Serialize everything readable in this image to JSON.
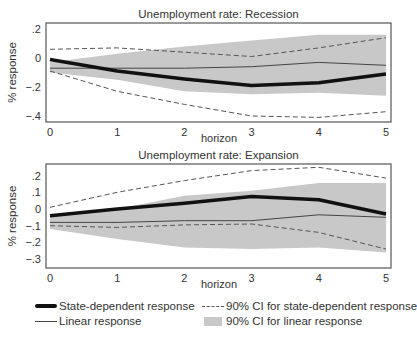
{
  "chart_data": [
    {
      "type": "line",
      "title": "Unemployment rate: Recession",
      "xlabel": "horizon",
      "ylabel": "% response",
      "x": [
        0,
        1,
        2,
        3,
        4,
        5
      ],
      "xticks": [
        "0",
        "1",
        "2",
        "3",
        "4",
        "5"
      ],
      "yticks": [
        0.2,
        0,
        -0.2,
        -0.4
      ],
      "ytick_labels": [
        ".2",
        "0",
        "-.2",
        "-.4"
      ],
      "ylim": [
        -0.44,
        0.24
      ],
      "grid": false,
      "series": [
        {
          "name": "State-dependent response",
          "values": [
            -0.01,
            -0.09,
            -0.145,
            -0.19,
            -0.17,
            -0.11
          ]
        },
        {
          "name": "Linear response",
          "values": [
            -0.07,
            -0.07,
            -0.07,
            -0.06,
            -0.03,
            -0.05
          ]
        },
        {
          "name": "90% CI for state-dependent response (upper)",
          "values": [
            0.06,
            0.07,
            0.04,
            0.01,
            0.07,
            0.14
          ]
        },
        {
          "name": "90% CI for state-dependent response (lower)",
          "values": [
            -0.09,
            -0.23,
            -0.32,
            -0.4,
            -0.41,
            -0.37
          ]
        },
        {
          "name": "90% CI for linear response (upper)",
          "values": [
            -0.03,
            0.03,
            0.08,
            0.12,
            0.16,
            0.16
          ]
        },
        {
          "name": "90% CI for linear response (lower)",
          "values": [
            -0.1,
            -0.15,
            -0.23,
            -0.25,
            -0.24,
            -0.26
          ]
        }
      ]
    },
    {
      "type": "line",
      "title": "Unemployment rate: Expansion",
      "xlabel": "horizon",
      "ylabel": "% response",
      "x": [
        0,
        1,
        2,
        3,
        4,
        5
      ],
      "xticks": [
        "0",
        "1",
        "2",
        "3",
        "4",
        "5"
      ],
      "yticks": [
        0.2,
        0.1,
        0,
        -0.1,
        -0.2,
        -0.3
      ],
      "ytick_labels": [
        ".2",
        ".1",
        "0",
        "-.1",
        "-.2",
        "-.3"
      ],
      "ylim": [
        -0.35,
        0.27
      ],
      "grid": false,
      "series": [
        {
          "name": "State-dependent response",
          "values": [
            -0.04,
            0.0,
            0.035,
            0.075,
            0.055,
            -0.03
          ]
        },
        {
          "name": "Linear response",
          "values": [
            -0.08,
            -0.08,
            -0.07,
            -0.07,
            -0.035,
            -0.05
          ]
        },
        {
          "name": "90% CI for state-dependent response (upper)",
          "values": [
            0.01,
            0.1,
            0.17,
            0.23,
            0.25,
            0.185
          ]
        },
        {
          "name": "90% CI for state-dependent response (lower)",
          "values": [
            -0.1,
            -0.11,
            -0.095,
            -0.09,
            -0.14,
            -0.24
          ]
        },
        {
          "name": "90% CI for linear response (upper)",
          "values": [
            -0.04,
            0.0,
            0.08,
            0.11,
            0.155,
            0.155
          ]
        },
        {
          "name": "90% CI for linear response (lower)",
          "values": [
            -0.12,
            -0.18,
            -0.23,
            -0.24,
            -0.23,
            -0.26
          ]
        }
      ]
    }
  ],
  "legend": {
    "position": "bottom",
    "items": [
      {
        "label": "State-dependent response",
        "style": "thick-solid"
      },
      {
        "label": "90% CI for state-dependent response",
        "style": "dashed"
      },
      {
        "label": "Linear response",
        "style": "thin-solid"
      },
      {
        "label": "90% CI for linear response",
        "style": "gray-fill"
      }
    ]
  },
  "colors": {
    "state_dependent": "#111111",
    "linear": "#444444",
    "ci_dashed": "#555555",
    "ci_fill": "#c8c8c8",
    "frame": "#555555",
    "text": "#333333"
  }
}
